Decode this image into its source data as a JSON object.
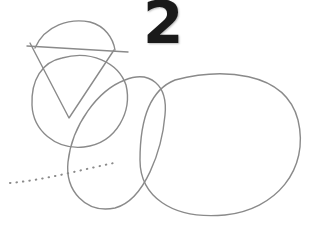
{
  "illustration": {
    "step_number": "2",
    "stroke_color": "#8a8a8a",
    "number_color": "#1a1a1a",
    "shapes": [
      "head-circle",
      "guide-triangle",
      "guide-line",
      "neck-ellipse",
      "body-ellipse",
      "dotted-tail-line"
    ]
  }
}
